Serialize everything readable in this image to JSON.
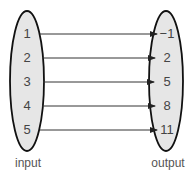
{
  "diagram": {
    "type": "mapping",
    "input": {
      "label": "input",
      "values": [
        "1",
        "2",
        "3",
        "4",
        "5"
      ]
    },
    "output": {
      "label": "output",
      "values": [
        "−1",
        "2",
        "5",
        "8",
        "11"
      ]
    },
    "mappings": [
      {
        "from": "1",
        "to": "−1"
      },
      {
        "from": "2",
        "to": "2"
      },
      {
        "from": "3",
        "to": "5"
      },
      {
        "from": "4",
        "to": "8"
      },
      {
        "from": "5",
        "to": "11"
      }
    ],
    "colors": {
      "ellipse_fill": "#e6e6e6",
      "ellipse_stroke": "#111111",
      "arrow": "#333333",
      "text": "#444444"
    }
  }
}
